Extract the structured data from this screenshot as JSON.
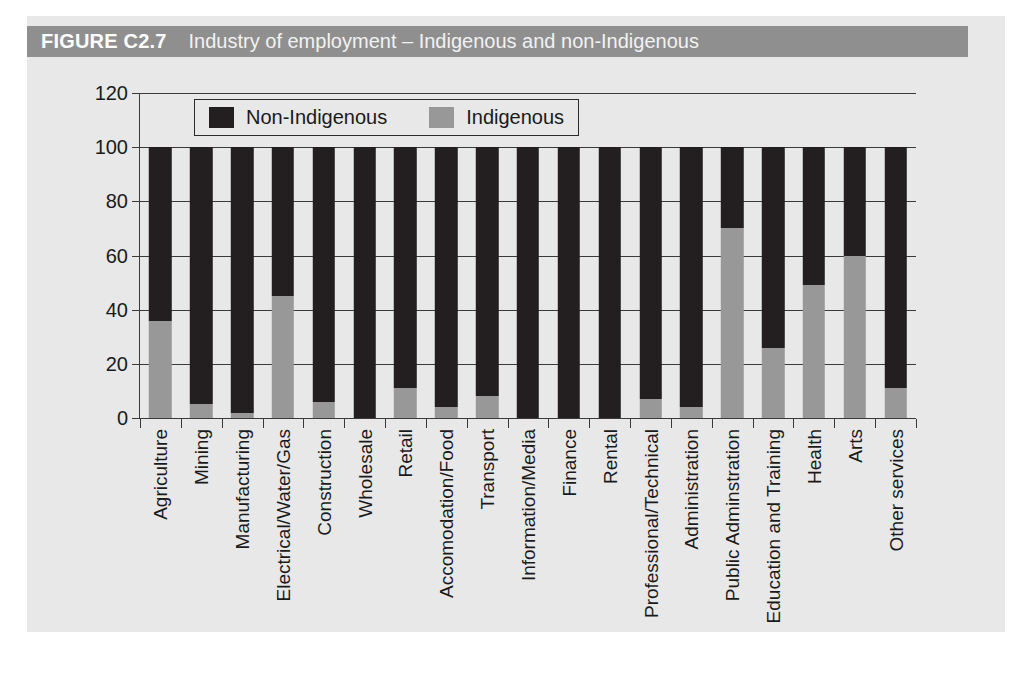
{
  "figure": {
    "number": "FIGURE C2.7",
    "caption": "Industry of employment – Indigenous and non-Indigenous",
    "band_color": "#8f8f8f",
    "panel_color": "#e8e8e8"
  },
  "legend": {
    "position": "top-center-inside",
    "items": [
      {
        "label": "Non-Indigenous",
        "color": "#231f20",
        "swatch": "legend-swatch-non-indigenous"
      },
      {
        "label": "Indigenous",
        "color": "#989898",
        "swatch": "legend-swatch-indigenous"
      }
    ]
  },
  "chart_data": {
    "type": "bar",
    "subtype": "stacked-100-percent",
    "title": "Industry of employment – Indigenous and non-Indigenous",
    "xlabel": "",
    "ylabel": "",
    "ylim": [
      0,
      120
    ],
    "yticks": [
      0,
      20,
      40,
      60,
      80,
      100,
      120
    ],
    "ytick_labels": [
      "0",
      "20",
      "40",
      "60",
      "80",
      "100",
      "120"
    ],
    "grid": true,
    "grid_axis": "y",
    "legend_entries": [
      "Non-Indigenous",
      "Indigenous"
    ],
    "categories": [
      "Agriculture",
      "Mining",
      "Manufacturing",
      "Electrical/Water/Gas",
      "Construction",
      "Wholesale",
      "Retail",
      "Accomodation/Food",
      "Transport",
      "Information/Media",
      "Finance",
      "Rental",
      "Professional/Technical",
      "Administration",
      "Public Adminstration",
      "Education and Training",
      "Health",
      "Arts",
      "Other services"
    ],
    "series": [
      {
        "name": "Indigenous",
        "color": "#989898",
        "values": [
          36,
          5,
          2,
          45,
          6,
          0,
          11,
          4,
          8,
          0,
          0,
          0,
          7,
          4,
          70,
          26,
          49,
          60,
          11
        ]
      },
      {
        "name": "Non-Indigenous",
        "color": "#231f20",
        "values": [
          64,
          95,
          98,
          55,
          94,
          100,
          89,
          96,
          92,
          100,
          100,
          100,
          93,
          96,
          30,
          74,
          51,
          40,
          89
        ]
      }
    ]
  }
}
